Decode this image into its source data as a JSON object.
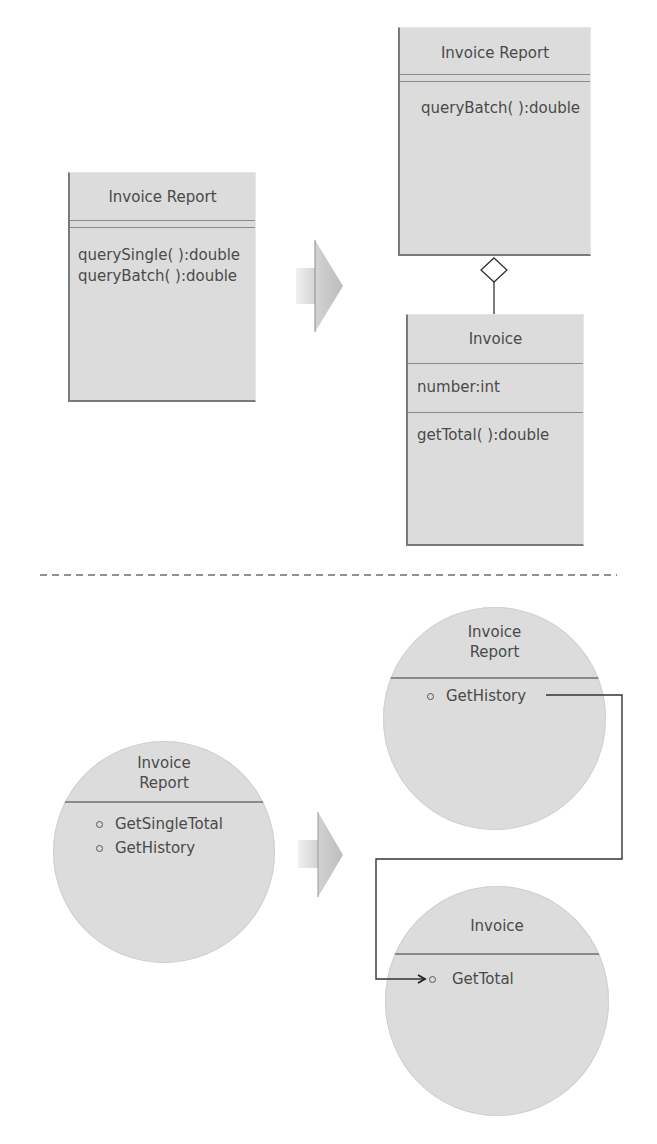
{
  "top_section": {
    "before": {
      "class_name": "Invoice Report",
      "operations": [
        "querySingle( ):double",
        "queryBatch( ):double"
      ]
    },
    "after": {
      "report_class": {
        "class_name": "Invoice Report",
        "operations": [
          "queryBatch( ):double"
        ]
      },
      "invoice_class": {
        "class_name": "Invoice",
        "attributes": [
          "number:int"
        ],
        "operations": [
          "getTotal( ):double"
        ]
      },
      "relationship": "aggregation"
    }
  },
  "bottom_section": {
    "before": {
      "component_name_line1": "Invoice",
      "component_name_line2": "Report",
      "interfaces": [
        "GetSingleTotal",
        "GetHistory"
      ]
    },
    "after": {
      "report_component": {
        "component_name_line1": "Invoice",
        "component_name_line2": "Report",
        "interfaces": [
          "GetHistory"
        ]
      },
      "invoice_component": {
        "component_name": "Invoice",
        "interfaces": [
          "GetTotal"
        ]
      },
      "connection": "GetHistory -> GetTotal"
    }
  },
  "colors": {
    "box_fill": "#dcdcdc",
    "border": "#7a7a7a",
    "text": "#4a4a4a",
    "arrow_fill": "#c8c8c8",
    "divider_dash": "#6e6e6e"
  }
}
